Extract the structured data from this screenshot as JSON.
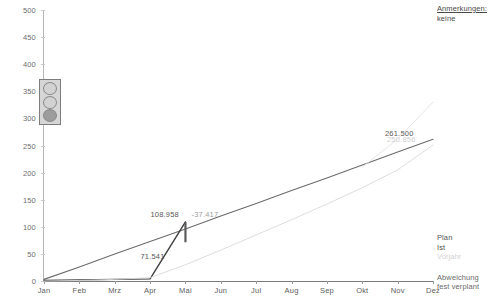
{
  "notes": {
    "title": "Anmerkungen:",
    "value": "keine"
  },
  "status_indicator": {
    "name": "traffic-light",
    "lamps": [
      "off",
      "off",
      "on"
    ]
  },
  "legend": {
    "items": [
      {
        "label": "Plan",
        "color": "#555555"
      },
      {
        "label": "Ist",
        "color": "#4d4d4d"
      },
      {
        "label": "Vorjahr",
        "color": "#d3d3d3"
      }
    ],
    "marker_items": [
      {
        "label": "Abweichung",
        "color": "#6a6a6a"
      },
      {
        "label": "fest verplant",
        "color": "#6a6a6a"
      }
    ]
  },
  "chart_data": {
    "type": "line",
    "title": "",
    "xlabel": "",
    "ylabel": "",
    "ylim": [
      0,
      500
    ],
    "yticks": [
      0,
      50,
      100,
      150,
      200,
      250,
      300,
      350,
      400,
      450,
      500
    ],
    "grid": false,
    "legend_position": "bottom-right",
    "categories": [
      "Jan",
      "Feb",
      "Mrz",
      "Apr",
      "Mai",
      "Jun",
      "Jul",
      "Aug",
      "Sep",
      "Okt",
      "Nov",
      "Dez"
    ],
    "series": [
      {
        "name": "Plan",
        "color": "#6b6b6b",
        "values": [
          3,
          26,
          50,
          73,
          96,
          120,
          143,
          167,
          190,
          214,
          238,
          261.5
        ]
      },
      {
        "name": "Ist",
        "color": "#3f3f3f",
        "values": [
          1,
          2,
          3,
          4,
          108.958,
          null,
          null,
          null,
          null,
          null,
          null,
          null
        ]
      },
      {
        "name": "Vorjahr",
        "color": "#d9d9d9",
        "values": [
          0,
          1,
          3,
          6,
          30,
          57,
          85,
          113,
          142,
          172,
          205,
          250.856
        ]
      },
      {
        "name": "Vorjahr-Trend",
        "color": "#e2e2e2",
        "values": [
          null,
          null,
          null,
          null,
          null,
          null,
          null,
          null,
          null,
          210,
          262,
          330
        ]
      }
    ],
    "annotations": [
      {
        "name": "ist-peak-label",
        "text": "108.958",
        "value": 108.958,
        "x": "Mai",
        "color": "#585858"
      },
      {
        "name": "plan-at-mai-label",
        "text": "71.541",
        "value": 71.541,
        "x": "Mai",
        "color": "#585858"
      },
      {
        "name": "deviation-label",
        "text": "-37.417",
        "value": -37.417,
        "x": "Mai",
        "color": "#9e9e9e"
      },
      {
        "name": "plan-end-label",
        "text": "261.500",
        "value": 261.5,
        "x": "Dez",
        "color": "#585858"
      },
      {
        "name": "vorjahr-end-label",
        "text": "250.856",
        "value": 250.856,
        "x": "Dez",
        "color": "#cfcfcf"
      }
    ],
    "deviation_bar": {
      "name": "abweichung-bar",
      "x": "Mai",
      "from": 71.541,
      "to": 108.958,
      "color": "#5a5a5a"
    }
  }
}
